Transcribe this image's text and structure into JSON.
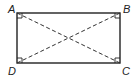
{
  "diagram": {
    "type": "rectangle-with-diagonals",
    "vertices": [
      {
        "label": "A",
        "x": 17,
        "y": 13,
        "lx": 8,
        "ly": 13
      },
      {
        "label": "B",
        "x": 120,
        "y": 13,
        "lx": 123,
        "ly": 13
      },
      {
        "label": "C",
        "x": 120,
        "y": 63,
        "lx": 122,
        "ly": 75
      },
      {
        "label": "D",
        "x": 17,
        "y": 63,
        "lx": 8,
        "ly": 75
      }
    ],
    "diagonals": [
      "AC",
      "BD"
    ],
    "diagonal_style": "dashed",
    "right_angle_markers": [
      "A",
      "B",
      "C",
      "D"
    ],
    "stroke_color": "#222222"
  }
}
